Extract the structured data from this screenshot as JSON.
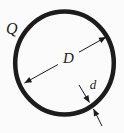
{
  "figure": {
    "background": "#fbfbfb",
    "ink": "#1c1c1c",
    "labels": {
      "charge": "Q",
      "diameter": "D",
      "thickness": "d"
    }
  }
}
